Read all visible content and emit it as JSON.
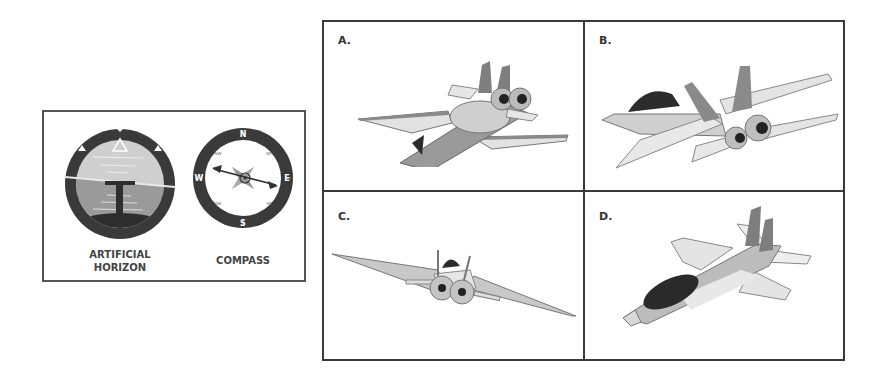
{
  "instruments_panel": {
    "instruments": [
      {
        "id": "artificial-horizon",
        "label_line1": "ARTIFICIAL",
        "label_line2": "HORIZON"
      },
      {
        "id": "compass",
        "label_line1": "COMPASS",
        "cardinals": {
          "n": "N",
          "e": "E",
          "s": "S",
          "w": "W"
        },
        "intercardinals": {
          "nw": "NW",
          "ne": "NE",
          "sw": "SW",
          "se": "SE"
        }
      }
    ]
  },
  "options": [
    {
      "label": "A.",
      "description": "Aircraft seen from behind, banked, nose pointing lower-left"
    },
    {
      "label": "B.",
      "description": "Aircraft seen from behind-right, nose pointing left, banked"
    },
    {
      "label": "C.",
      "description": "Aircraft seen from behind, banked steeply to the right"
    },
    {
      "label": "D.",
      "description": "Aircraft seen from above, nose pointing lower-left"
    }
  ],
  "colors": {
    "border": "#3a3a3a",
    "sky": "#c8c8c8",
    "ground": "#8a8a8a",
    "dark": "#2a2a2a",
    "aircraft_light": "#d8d8d8",
    "aircraft_mid": "#a8a8a8",
    "aircraft_dark": "#7a7a7a"
  }
}
